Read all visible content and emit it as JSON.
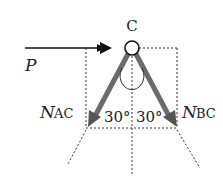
{
  "diagram": {
    "node": {
      "label": "C"
    },
    "force_p": {
      "label": "P"
    },
    "force_nac": {
      "main": "N",
      "sub": "AC"
    },
    "force_nbc": {
      "main": "N",
      "sub": "BC"
    },
    "angle_left": {
      "label": "30°"
    },
    "angle_right": {
      "label": "30°"
    },
    "colors": {
      "line": "#222222",
      "member": "#6b6b6b",
      "dashed": "#333333"
    }
  }
}
